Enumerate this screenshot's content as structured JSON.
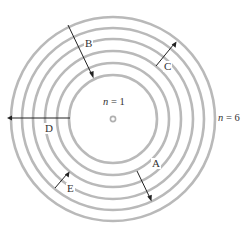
{
  "diagram": {
    "title_cropped": "",
    "center": {
      "x": 113,
      "y": 119
    },
    "ring_color": "#b9b9b9",
    "arrow_color": "#222222",
    "rings": [
      {
        "n": 1,
        "radius": 44
      },
      {
        "n": 2,
        "radius": 56
      },
      {
        "n": 3,
        "radius": 68
      },
      {
        "n": 4,
        "radius": 80
      },
      {
        "n": 5,
        "radius": 91
      },
      {
        "n": 6,
        "radius": 102
      }
    ],
    "level_labels": {
      "inner": {
        "var": "n",
        "eq": " = ",
        "value": "1"
      },
      "outer": {
        "var": "n",
        "eq": " = ",
        "value": "6"
      }
    },
    "transitions": [
      {
        "label": "A",
        "from_n": 2,
        "to_n": 5,
        "direction": "outward"
      },
      {
        "label": "B",
        "from_n": 6,
        "to_n": 2,
        "direction": "inward"
      },
      {
        "label": "C",
        "from_n": 4,
        "to_n": 6,
        "direction": "outward"
      },
      {
        "label": "D",
        "from_n": 1,
        "to_n": 6,
        "direction": "outward"
      },
      {
        "label": "E",
        "from_n": 6,
        "to_n": 5,
        "direction": "inward"
      }
    ]
  }
}
